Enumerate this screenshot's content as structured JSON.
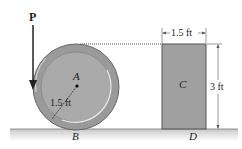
{
  "figure": {
    "force_label": "P",
    "spool_center_label": "A",
    "spool_radius_label": "1.5 ft",
    "spool_contact_label": "B",
    "block_label": "C",
    "block_contact_label": "D",
    "block_width_label": "1.5 ft",
    "block_height_label": "3 ft",
    "colors": {
      "spool_outer": "#9a9a9a",
      "spool_inner": "#a8a8a8",
      "block_fill": "#a0a0a0",
      "ground": "#cfcfcf",
      "rope": "#888888"
    }
  }
}
